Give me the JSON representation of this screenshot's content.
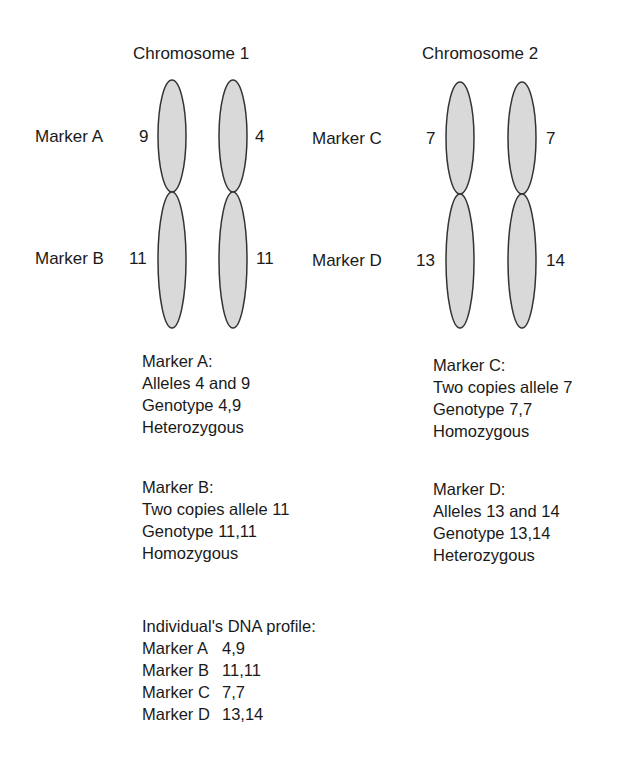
{
  "chromosome1": {
    "title": "Chromosome 1",
    "markers": [
      {
        "name": "Marker A",
        "left_allele": "9",
        "right_allele": "4"
      },
      {
        "name": "Marker B",
        "left_allele": "11",
        "right_allele": "11"
      }
    ]
  },
  "chromosome2": {
    "title": "Chromosome 2",
    "markers": [
      {
        "name": "Marker C",
        "left_allele": "7",
        "right_allele": "7"
      },
      {
        "name": "Marker D",
        "left_allele": "13",
        "right_allele": "14"
      }
    ]
  },
  "summaries": {
    "marker_a": [
      "Marker A:",
      "Alleles 4 and 9",
      "Genotype 4,9",
      "Heterozygous"
    ],
    "marker_b": [
      "Marker B:",
      "Two copies allele 11",
      "Genotype 11,11",
      "Homozygous"
    ],
    "marker_c": [
      "Marker C:",
      "Two copies allele 7",
      "Genotype 7,7",
      "Homozygous"
    ],
    "marker_d": [
      "Marker D:",
      "Alleles 13 and 14",
      "Genotype 13,14",
      "Heterozygous"
    ]
  },
  "profile": {
    "title": "Individual's DNA profile:",
    "rows": [
      {
        "marker": "Marker A",
        "genotype": "4,9"
      },
      {
        "marker": "Marker B",
        "genotype": "11,11"
      },
      {
        "marker": "Marker C",
        "genotype": "7,7"
      },
      {
        "marker": "Marker D",
        "genotype": "13,14"
      }
    ]
  },
  "colors": {
    "chromatid_fill": "#d9d9d9",
    "chromatid_stroke": "#333333",
    "text": "#1a1a1a"
  }
}
